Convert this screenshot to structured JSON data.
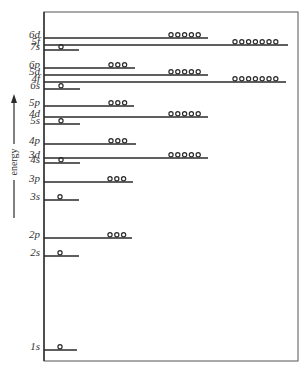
{
  "diagram": {
    "title": "",
    "axis_label": "energy",
    "colors": {
      "ink": "#2a2a2a",
      "background": "#ffffff"
    },
    "frame": {
      "x1": 44,
      "y1": 12,
      "x2": 298,
      "y2": 361
    },
    "arrow": {
      "x": 14,
      "y_top": 94,
      "y_bottom": 218,
      "label_y": 162
    },
    "levels": [
      {
        "label": "6d",
        "y": 38,
        "x_end": 208,
        "electrons": 5,
        "circ_start": 171
      },
      {
        "label": "5f",
        "y": 45,
        "x_end": 288,
        "electrons": 7,
        "circ_start": 235
      },
      {
        "label": "7s",
        "y": 50,
        "x_end": 79,
        "electrons": 1,
        "circ_start": 61
      },
      {
        "label": "6p",
        "y": 68,
        "x_end": 135,
        "electrons": 3,
        "circ_start": 111
      },
      {
        "label": "5d",
        "y": 75,
        "x_end": 208,
        "electrons": 5,
        "circ_start": 171
      },
      {
        "label": "4f",
        "y": 82,
        "x_end": 286,
        "electrons": 7,
        "circ_start": 235
      },
      {
        "label": "6s",
        "y": 89,
        "x_end": 80,
        "electrons": 1,
        "circ_start": 61
      },
      {
        "label": "5p",
        "y": 106,
        "x_end": 134,
        "electrons": 3,
        "circ_start": 111
      },
      {
        "label": "4d",
        "y": 117,
        "x_end": 208,
        "electrons": 5,
        "circ_start": 171
      },
      {
        "label": "5s",
        "y": 124,
        "x_end": 80,
        "electrons": 1,
        "circ_start": 61
      },
      {
        "label": "4p",
        "y": 144,
        "x_end": 136,
        "electrons": 3,
        "circ_start": 111
      },
      {
        "label": "3d",
        "y": 158,
        "x_end": 208,
        "electrons": 5,
        "circ_start": 171
      },
      {
        "label": "4s",
        "y": 163,
        "x_end": 80,
        "electrons": 1,
        "circ_start": 61
      },
      {
        "label": "3p",
        "y": 182,
        "x_end": 133,
        "electrons": 3,
        "circ_start": 110
      },
      {
        "label": "3s",
        "y": 200,
        "x_end": 79,
        "electrons": 1,
        "circ_start": 60
      },
      {
        "label": "2p",
        "y": 238,
        "x_end": 132,
        "electrons": 3,
        "circ_start": 110
      },
      {
        "label": "2s",
        "y": 256,
        "x_end": 79,
        "electrons": 1,
        "circ_start": 60
      },
      {
        "label": "1s",
        "y": 350,
        "x_end": 77,
        "electrons": 1,
        "circ_start": 60
      }
    ]
  }
}
